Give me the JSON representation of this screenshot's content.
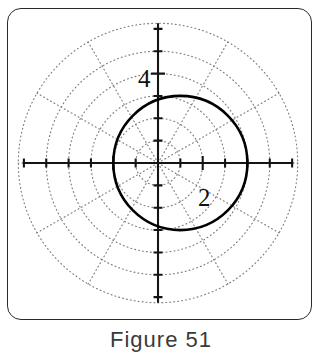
{
  "figure": {
    "caption": "Figure 51",
    "frame_color": "#2a2a2a",
    "background_color": "#ffffff"
  },
  "axis_labels": {
    "radial_4": "4",
    "radial_2": "2"
  },
  "chart_data": {
    "type": "line",
    "title": "",
    "subtitle": "",
    "coordinate_system": "polar",
    "xlabel": "",
    "ylabel": "",
    "grid": true,
    "legend": null,
    "legend_position": "none",
    "curve_color": "#000000",
    "grid_color": "#808080",
    "axis_color": "#1a1a1a",
    "polar_grid": {
      "radial_circles": [
        1,
        2,
        3,
        4,
        5,
        6.25
      ],
      "angular_spokes_deg": [
        0,
        30,
        60,
        90,
        120,
        150,
        180,
        210,
        240,
        270,
        300,
        330
      ],
      "spoke_count": 12,
      "angular_step_deg": 30,
      "style": "dotted"
    },
    "axes": {
      "x_range": [
        -6.05,
        6.05
      ],
      "y_range": [
        -6.25,
        6.25
      ],
      "x_tick_step": 1,
      "y_tick_step": 1,
      "labeled_ticks_y": [
        4
      ],
      "labeled_ticks_x": [],
      "major_tick_values_x": [
        -2,
        2
      ],
      "origin_units": [
        0,
        0
      ]
    },
    "series": [
      {
        "name": "circle",
        "description": "circle of radius 3 centered at (1, 0)",
        "equation_cartesian": "(x - 1)^2 + y^2 = 9",
        "equation_polar": "r = cos(theta) + sqrt(9 - sin(theta)^2) * ... (limacon-free circle)",
        "center": [
          1,
          0
        ],
        "radius": 3,
        "closed": true,
        "linewidth": 2.6,
        "points_xy": [
          [
            4.0,
            0.0
          ],
          [
            3.9,
            0.78
          ],
          [
            3.6,
            1.5
          ],
          [
            3.12,
            2.12
          ],
          [
            2.5,
            2.6
          ],
          [
            1.78,
            2.9
          ],
          [
            1.0,
            3.0
          ],
          [
            0.22,
            2.9
          ],
          [
            -0.5,
            2.6
          ],
          [
            -1.12,
            2.12
          ],
          [
            -1.6,
            1.5
          ],
          [
            -1.9,
            0.78
          ],
          [
            -2.0,
            0.0
          ],
          [
            -1.9,
            -0.78
          ],
          [
            -1.6,
            -1.5
          ],
          [
            -1.12,
            -2.12
          ],
          [
            -0.5,
            -2.6
          ],
          [
            0.22,
            -2.9
          ],
          [
            1.0,
            -3.0
          ],
          [
            1.78,
            -2.9
          ],
          [
            2.5,
            -2.6
          ],
          [
            3.12,
            -2.12
          ],
          [
            3.6,
            -1.5
          ],
          [
            3.9,
            -0.78
          ],
          [
            4.0,
            0.0
          ]
        ]
      }
    ],
    "annotations": [
      {
        "text": "4",
        "at_xy": [
          -0.55,
          4.0
        ],
        "role": "radial-tick-label"
      },
      {
        "text": "2",
        "at_xy": [
          1.6,
          -0.85
        ],
        "role": "radial-tick-label"
      }
    ]
  }
}
